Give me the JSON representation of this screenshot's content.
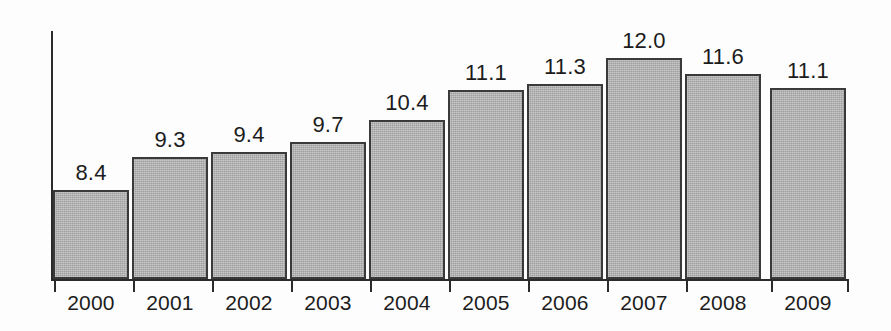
{
  "chart_data": {
    "type": "bar",
    "title": "",
    "subtitle": "",
    "xlabel": "",
    "ylabel": "",
    "categories": [
      "2000",
      "2001",
      "2002",
      "2003",
      "2004",
      "2005",
      "2006",
      "2007",
      "2008",
      "2009"
    ],
    "values": [
      8.4,
      9.3,
      9.4,
      9.7,
      10.4,
      11.1,
      11.3,
      12.0,
      11.6,
      11.1
    ],
    "data_labels": [
      "8.4",
      "9.3",
      "9.4",
      "9.7",
      "10.4",
      "11.1",
      "11.3",
      "12.0",
      "11.6",
      "11.1"
    ],
    "series": [
      {
        "name": "",
        "values": [
          8.4,
          9.3,
          9.4,
          9.7,
          10.4,
          11.1,
          11.3,
          12.0,
          11.6,
          11.1
        ]
      }
    ],
    "ylim": [
      5.8,
      13.3
    ],
    "baseline_value": 5.8,
    "grid": false,
    "legend": false,
    "legend_position": "none",
    "tick_labels_y": [],
    "annotations": [],
    "colors": {
      "bar_fill": "#b2b2b2",
      "bar_border": "#3a3a3a",
      "axis": "#2b2b2b",
      "text": "#1c1c1c",
      "background": "#fdfdfd"
    }
  },
  "bars": [
    {
      "year": "2000",
      "label": "8.4",
      "value": 8.4,
      "x": 53,
      "width": 76,
      "top": 190
    },
    {
      "year": "2001",
      "label": "9.3",
      "value": 9.3,
      "x": 132,
      "width": 76,
      "top": 157
    },
    {
      "year": "2002",
      "label": "9.4",
      "value": 9.4,
      "x": 211,
      "width": 76,
      "top": 152
    },
    {
      "year": "2003",
      "label": "9.7",
      "value": 9.7,
      "x": 290,
      "width": 76,
      "top": 142
    },
    {
      "year": "2004",
      "label": "10.4",
      "value": 10.4,
      "x": 369,
      "width": 76,
      "top": 120
    },
    {
      "year": "2005",
      "label": "11.1",
      "value": 11.1,
      "x": 448,
      "width": 76,
      "top": 90
    },
    {
      "year": "2006",
      "label": "11.3",
      "value": 11.3,
      "x": 527,
      "width": 76,
      "top": 84
    },
    {
      "year": "2007",
      "label": "12.0",
      "value": 12.0,
      "x": 606,
      "width": 76,
      "top": 58
    },
    {
      "year": "2008",
      "label": "11.6",
      "value": 11.6,
      "x": 685,
      "width": 76,
      "top": 74
    },
    {
      "year": "2009",
      "label": "11.1",
      "value": 11.1,
      "x": 770,
      "width": 76,
      "top": 88
    }
  ]
}
